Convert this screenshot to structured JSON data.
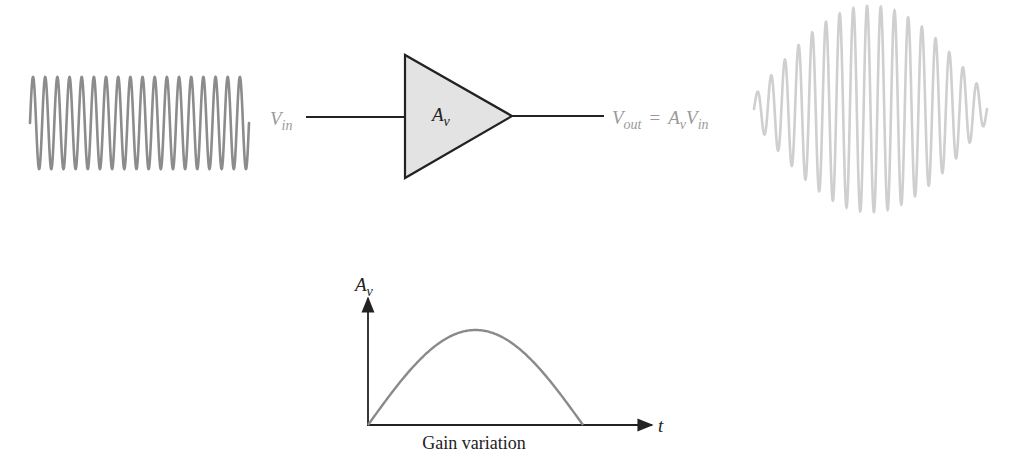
{
  "diagram": {
    "colors": {
      "input_wave": "#8c8c8c",
      "output_wave": "#cfcfcf",
      "amplifier_fill": "#e3e3e3",
      "line": "#222222",
      "label_gray": "#9a9a9a",
      "label_dark": "#222222",
      "gain_curve": "#8a8a8a"
    },
    "input_signal": {
      "label_main": "V",
      "label_sub": "in",
      "cycles": 18,
      "x_start": 30,
      "x_end": 249,
      "center_y": 123,
      "amplitude": 46
    },
    "amplifier": {
      "label_main": "A",
      "label_sub": "v",
      "left_x": 405,
      "top_y": 55,
      "bottom_y": 178,
      "tip_x": 512,
      "tip_y": 116
    },
    "output_signal": {
      "label_main": "V",
      "label_sub": "out",
      "equals": "=",
      "rhs_main1": "A",
      "rhs_sub1": "v",
      "rhs_main2": "V",
      "rhs_sub2": "in",
      "cycles": 17,
      "x_start": 754,
      "x_end": 987,
      "center_y": 109,
      "max_amplitude": 103,
      "min_amplitude": 13
    },
    "gain_graph": {
      "y_axis_label_main": "A",
      "y_axis_label_sub": "v",
      "x_axis_label": "t",
      "caption": "Gain variation",
      "origin_x": 368,
      "origin_y": 425,
      "y_axis_top": 297,
      "x_axis_right": 652,
      "curve_end_x": 583,
      "curve_peak_y": 330
    }
  },
  "chart_data": {
    "type": "line",
    "title": "Gain variation",
    "xlabel": "t",
    "ylabel": "A_v",
    "x": [
      0,
      0.1,
      0.2,
      0.3,
      0.4,
      0.5,
      0.6,
      0.7,
      0.8,
      0.9,
      1.0
    ],
    "values": [
      0,
      0.31,
      0.59,
      0.81,
      0.95,
      1.0,
      0.95,
      0.81,
      0.59,
      0.31,
      0
    ],
    "grid": false,
    "legend": "none"
  }
}
